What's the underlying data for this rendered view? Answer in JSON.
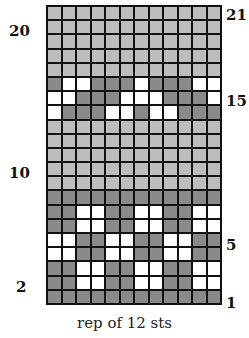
{
  "chart_data": {
    "type": "table",
    "columns": 12,
    "rows": 21,
    "legend": {
      "L": "light gray",
      "D": "dark gray",
      "W": "white"
    },
    "colors": {
      "L": "#bdbdbd",
      "D": "#8a8a8a",
      "W": "#ffffff",
      "grid": "#111111"
    },
    "rows_top_to_bottom": [
      "LLLLLLLLLLLL",
      "LLLLLLLLLLLL",
      "LLLLLLLLLLLL",
      "LLLLLLLLLLLL",
      "LLLLLLLLLLLL",
      "DWWDDDWDDDWW",
      "WWDDDWWWDDDW",
      "WDDDWWDWWDDD",
      "LLLLLLLLLLLL",
      "LLLLLLLLLLLL",
      "LLLLLLLLLLLL",
      "LLLLLLLLLLLL",
      "LLLLLLLLLLLL",
      "DDDDDDDDDDDD",
      "DDWWDDWWDDWW",
      "DDWWDDWWDDWW",
      "WWDDWWDDWWDD",
      "WWDDWWDDWWDD",
      "DDWWDDWWDDWW",
      "DDWWDDWWDDWW",
      "DDDDDDDDDDDD"
    ],
    "row_labels": [
      {
        "text": "21",
        "side": "right",
        "row": 21
      },
      {
        "text": "20",
        "side": "left",
        "row": 20
      },
      {
        "text": "15",
        "side": "right",
        "row": 15
      },
      {
        "text": "10",
        "side": "left",
        "row": 10
      },
      {
        "text": "5",
        "side": "right",
        "row": 5
      },
      {
        "text": "2",
        "side": "left",
        "row": 2
      },
      {
        "text": "1",
        "side": "right",
        "row": 1
      }
    ],
    "xlabel": "rep of 12 sts"
  },
  "labels": {
    "r21": "21",
    "r20": "20",
    "r15": "15",
    "r10": "10",
    "r5": "5",
    "r2": "2",
    "r1": "1"
  },
  "caption": "rep of 12 sts"
}
